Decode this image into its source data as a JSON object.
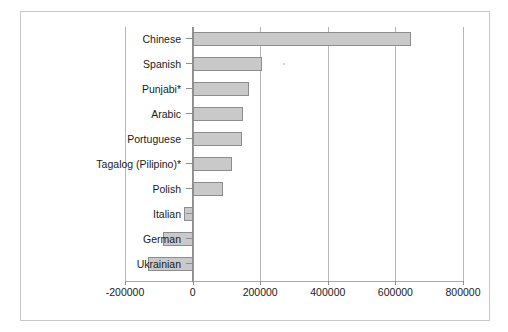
{
  "chart_data": {
    "type": "bar",
    "orientation": "horizontal",
    "title": "",
    "subtitle": "",
    "xlabel": "",
    "ylabel": "",
    "categories": [
      "Chinese",
      "Spanish",
      "Punjabi*",
      "Arabic",
      "Portuguese",
      "Tagalog (Pilipino)*",
      "Polish",
      "Italian",
      "German",
      "Ukrainian"
    ],
    "values": [
      645000,
      205000,
      168000,
      148000,
      146000,
      118000,
      90000,
      -24000,
      -88000,
      -132000
    ],
    "xlim": [
      -200000,
      800000
    ],
    "xticks": [
      -200000,
      0,
      200000,
      400000,
      600000,
      800000
    ],
    "xtick_labels": [
      "-200000",
      "0",
      "200000",
      "400000",
      "600000",
      "800000"
    ],
    "grid": true,
    "grid_axis": "x",
    "legend": false,
    "legend_position": "none",
    "bar_fill_color": "#c9c9c9",
    "bar_edge_color": "#8c8c8c",
    "gridline_color": "#b6b6b6",
    "axis_color": "#8f8f8f",
    "frame_color": "#c9c9c9",
    "background_color": "#ffffff"
  }
}
